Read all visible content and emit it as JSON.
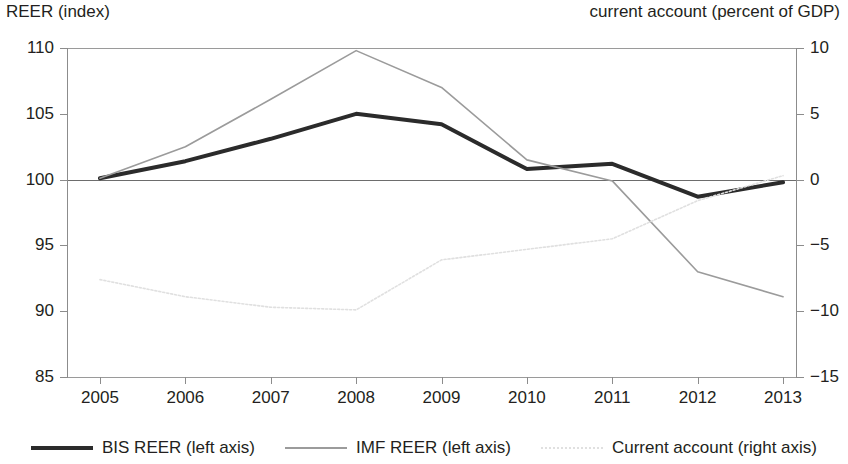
{
  "axes": {
    "left_title": "REER (index)",
    "right_title": "current account (percent of GDP)",
    "left_ticks": [
      "110",
      "105",
      "100",
      "95",
      "90",
      "85"
    ],
    "right_ticks": [
      "10",
      "5",
      "0",
      "−5",
      "−10",
      "−15"
    ],
    "x_ticks": [
      "2005",
      "2006",
      "2007",
      "2008",
      "2009",
      "2010",
      "2011",
      "2012",
      "2013"
    ]
  },
  "legend": {
    "items": [
      {
        "label": "BIS REER (left axis)",
        "color": "#2b2b2b",
        "style": "solid-thick"
      },
      {
        "label": "IMF REER (left axis)",
        "color": "#9b9b9b",
        "style": "solid-thin"
      },
      {
        "label": "Current account (right axis)",
        "color": "#e0e0e0",
        "style": "dotted"
      }
    ]
  },
  "chart_data": {
    "type": "line",
    "title": "",
    "xlabel": "",
    "ylabel": "REER (index)",
    "y2label": "current account (percent of GDP)",
    "x": [
      2005,
      2006,
      2007,
      2008,
      2009,
      2010,
      2011,
      2012,
      2013
    ],
    "ylim": [
      85,
      110
    ],
    "y2lim": [
      -15,
      10
    ],
    "grid": true,
    "legend_position": "bottom",
    "series": [
      {
        "name": "BIS REER (left axis)",
        "axis": "left",
        "color": "#2b2b2b",
        "values": [
          100.1,
          101.4,
          103.1,
          105.0,
          104.2,
          100.8,
          101.2,
          98.7,
          99.8
        ]
      },
      {
        "name": "IMF REER (left axis)",
        "axis": "left",
        "color": "#9b9b9b",
        "values": [
          100.1,
          102.5,
          106.1,
          109.8,
          107.0,
          101.5,
          99.9,
          93.0,
          91.1
        ]
      },
      {
        "name": "Current account (right axis)",
        "axis": "right",
        "color": "#e0e0e0",
        "values": [
          -7.6,
          -8.9,
          -9.7,
          -9.9,
          -6.1,
          -5.3,
          -4.5,
          -1.6,
          0.3
        ]
      }
    ]
  }
}
